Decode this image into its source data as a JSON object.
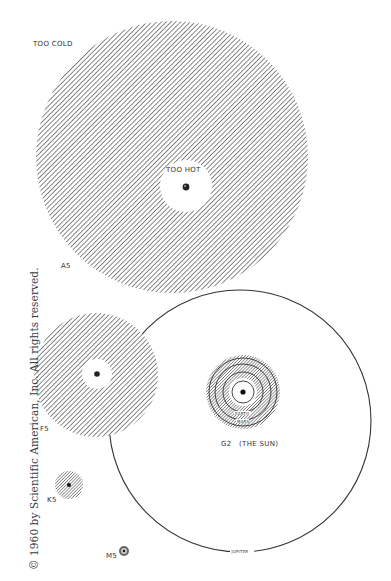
{
  "labels": {
    "too_cold": "TOO COLD",
    "too_hot": "TOO HOT",
    "a5": "A5",
    "f5": "F5",
    "g2": "G2   (THE SUN)",
    "k5": "K5",
    "m5": "M5",
    "jupiter": "JUPITER",
    "earth": "EARTH",
    "mars": "MARS",
    "venus": "VENUS"
  },
  "copyright": "© 1960 by Scientific American, Inc. All rights reserved.",
  "colors": {
    "ink": "#333333",
    "background": "#ffffff"
  },
  "stars": [
    {
      "type": "A5",
      "cx": 172,
      "cy": 157,
      "r": 136,
      "inner_r": 26,
      "inner_cx": 186,
      "inner_cy": 186
    },
    {
      "type": "F5",
      "cx": 96,
      "cy": 375,
      "r": 62,
      "inner_r": 16,
      "inner_cx": 97,
      "inner_cy": 374
    },
    {
      "type": "G2",
      "cx": 243,
      "cy": 392,
      "r": 37,
      "inner_r": 12
    },
    {
      "type": "K5",
      "cx": 69,
      "cy": 485,
      "r": 14
    },
    {
      "type": "M5",
      "cx": 124,
      "cy": 551,
      "r": 5
    }
  ],
  "jupiter_orbit": {
    "cx": 240,
    "cy": 421,
    "r": 131
  }
}
